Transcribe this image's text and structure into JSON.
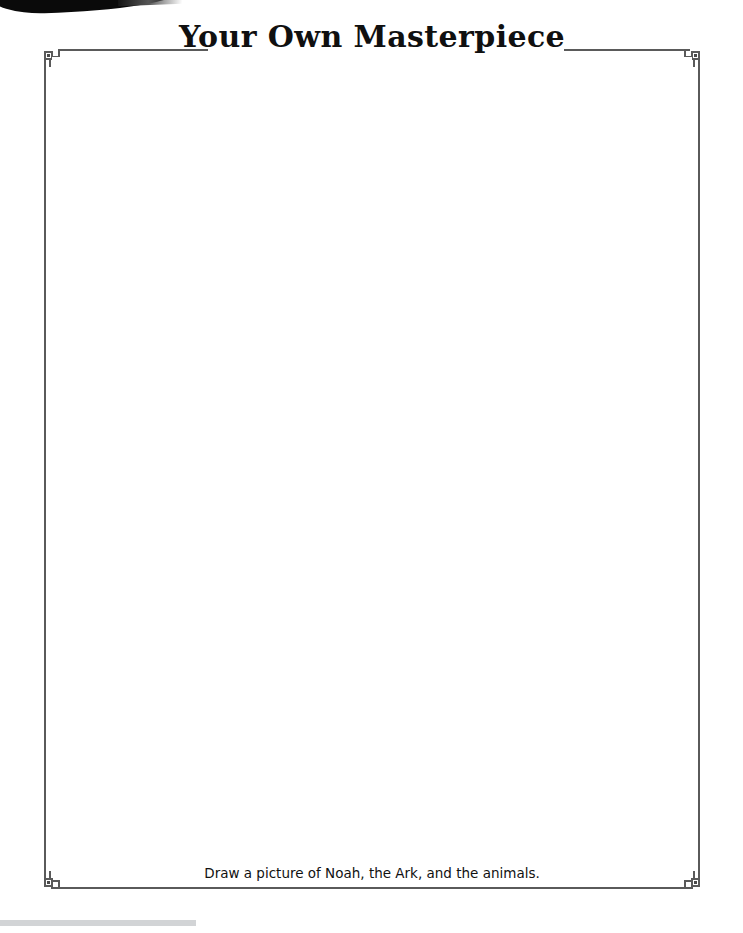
{
  "page": {
    "title": "Your Own Masterpiece",
    "caption": "Draw a picture of Noah, the Ark, and the animals.",
    "background_color": "#ffffff",
    "frame_color": "#5a5a5a",
    "title_color": "#101010",
    "caption_color": "#111111",
    "scan_edge_color": "#0a0a0a",
    "footer_bar_color": "#d2d4d6"
  },
  "frame": {
    "corners": [
      {
        "name": "top-left",
        "ornament": "stepped-notch-with-square"
      },
      {
        "name": "top-right",
        "ornament": "stepped-notch-with-square"
      },
      {
        "name": "bottom-left",
        "ornament": "stepped-notch-with-square"
      },
      {
        "name": "bottom-right",
        "ornament": "stepped-notch-with-square"
      }
    ],
    "top_rule_left": "",
    "top_rule_right": ""
  },
  "canvas": {
    "content": "",
    "placeholder": "blank drawing area"
  }
}
